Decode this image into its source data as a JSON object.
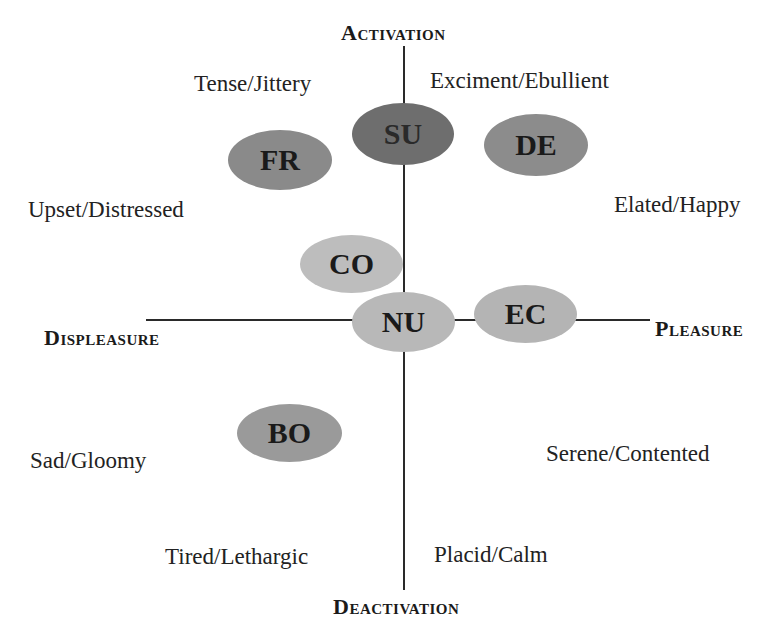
{
  "diagram": {
    "type": "circumplex-model-of-affect",
    "axes": {
      "top": "Activation",
      "bottom": "Deactivation",
      "left": "Displeasure",
      "right": "Pleasure"
    },
    "quadrant_labels": [
      {
        "id": "tense",
        "text": "Tense/Jittery"
      },
      {
        "id": "excitement",
        "text": "Exciment/Ebullient"
      },
      {
        "id": "upset",
        "text": "Upset/Distressed"
      },
      {
        "id": "elated",
        "text": "Elated/Happy"
      },
      {
        "id": "sad",
        "text": "Sad/Gloomy"
      },
      {
        "id": "serene",
        "text": "Serene/Contented"
      },
      {
        "id": "tired",
        "text": "Tired/Lethargic"
      },
      {
        "id": "placid",
        "text": "Placid/Calm"
      }
    ],
    "nodes": [
      {
        "id": "SU",
        "label": "SU",
        "color": "#6e6e6e"
      },
      {
        "id": "FR",
        "label": "FR",
        "color": "#8a8a8a"
      },
      {
        "id": "DE",
        "label": "DE",
        "color": "#8c8c8c"
      },
      {
        "id": "CO",
        "label": "CO",
        "color": "#bdbdbd"
      },
      {
        "id": "NU",
        "label": "NU",
        "color": "#b8b8b8"
      },
      {
        "id": "EC",
        "label": "EC",
        "color": "#b4b4b4"
      },
      {
        "id": "BO",
        "label": "BO",
        "color": "#9a9a9a"
      }
    ]
  }
}
